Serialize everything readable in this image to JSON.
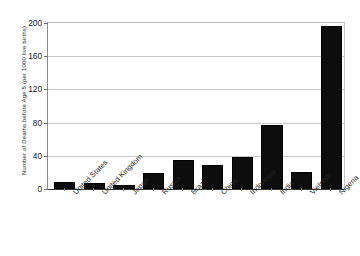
{
  "chart_data": {
    "type": "bar",
    "title": "",
    "xlabel": "",
    "ylabel": "Number of Deaths before Age 5 (per 1000 live births)",
    "ylim": [
      0,
      200
    ],
    "ytick_values": [
      0,
      40,
      80,
      120,
      160,
      200
    ],
    "ytick_labels": [
      "0",
      "40",
      "80",
      "120",
      "160",
      "200"
    ],
    "grid": true,
    "legend": false,
    "bar_color": "#0d0d0d",
    "categories": [
      "United States",
      "United Kingdom",
      "Japan",
      "Russia",
      "Brazil",
      "China",
      "Indonesia",
      "India",
      "Vietnam",
      "Nigeria"
    ],
    "values": [
      8,
      7,
      5,
      19,
      35,
      29,
      39,
      77,
      21,
      196
    ]
  }
}
